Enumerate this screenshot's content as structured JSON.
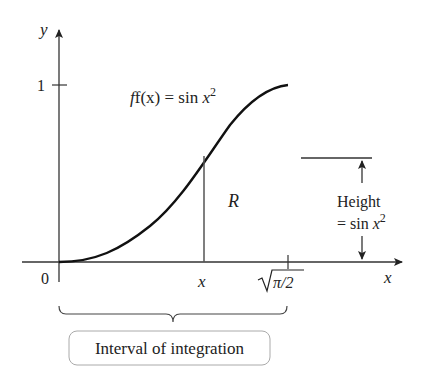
{
  "figure": {
    "axes": {
      "x_label": "x",
      "y_label": "y",
      "origin_label": "0",
      "y_tick_label": "1",
      "x_point_label": "x",
      "x_end_label_radicand": "π/2"
    },
    "function_label": {
      "prefix": "f(x) = sin ",
      "var": "x",
      "exp": "2"
    },
    "region_label": "R",
    "height_annotation": {
      "line1": "Height",
      "line2_prefix": "= sin ",
      "line2_var": "x",
      "line2_exp": "2"
    },
    "interval_label": "Interval of integration",
    "colors": {
      "stroke": "#222222",
      "axis": "#333333",
      "box_border": "#999999"
    }
  }
}
